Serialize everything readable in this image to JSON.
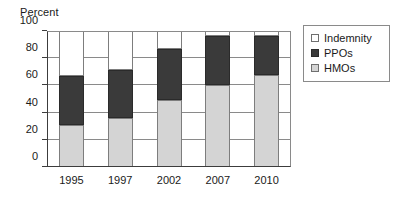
{
  "chart_data": {
    "type": "bar",
    "subtype": "stacked-vertical",
    "title": "",
    "xlabel": "",
    "ylabel": "Percent",
    "ylim": [
      0,
      100
    ],
    "ytick_labels": [
      "0",
      "20",
      "40",
      "60",
      "80",
      "100"
    ],
    "yticks": [
      0,
      20,
      40,
      60,
      80,
      100
    ],
    "grid": "horizontal",
    "categories": [
      "1995",
      "1997",
      "2002",
      "2007",
      "2010"
    ],
    "legend_position": "right",
    "series": [
      {
        "name": "Indemnity",
        "color": "#ffffff",
        "values": [
          33,
          29,
          13,
          4,
          4
        ]
      },
      {
        "name": "PPOs",
        "color": "#3a3a3a",
        "values": [
          36,
          35,
          38,
          36,
          28
        ]
      },
      {
        "name": "HMOs",
        "color": "#d4d4d4",
        "values": [
          31,
          36,
          49,
          60,
          68
        ]
      }
    ],
    "stack_order_bottom_to_top": [
      "HMOs",
      "PPOs",
      "Indemnity"
    ],
    "cumulative_tops": {
      "HMOs": [
        31,
        36,
        49,
        60,
        68
      ],
      "PPOs": [
        67,
        71,
        87,
        96,
        96
      ],
      "Indemnity": [
        100,
        100,
        100,
        100,
        100
      ]
    }
  },
  "axes": {
    "y_title": "Percent",
    "y_tick_labels": [
      "100",
      "80",
      "60",
      "40",
      "20",
      "0"
    ],
    "x_tick_labels": [
      "1995",
      "1997",
      "2002",
      "2007",
      "2010"
    ]
  },
  "legend": {
    "items": [
      {
        "label": "Indemnity",
        "swatch": "legend-swatch-indemnity"
      },
      {
        "label": "PPOs",
        "swatch": "legend-swatch-ppos"
      },
      {
        "label": "HMOs",
        "swatch": "legend-swatch-hmos"
      }
    ]
  },
  "colors": {
    "indemnity": "#ffffff",
    "ppos": "#3a3a3a",
    "hmos": "#d4d4d4",
    "axis": "#3c3c3c",
    "grid": "#8a8a8a",
    "text": "#1a1a1a"
  }
}
